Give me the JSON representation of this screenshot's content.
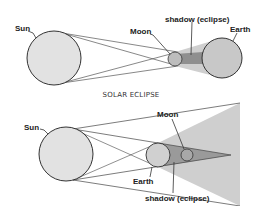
{
  "solar_diagram": {
    "labels": {
      "sun": "Sun",
      "moon": "Moon",
      "earth": "Earth",
      "shadow": "shadow (eclipse)"
    }
  },
  "caption": "SOLAR ECLIPSE",
  "lunar_diagram": {
    "labels": {
      "sun": "Sun",
      "moon": "Moon",
      "earth": "Earth",
      "shadow": "shadow (eclipse)"
    }
  },
  "colors": {
    "body_fill": "#d9d9d9",
    "penumbra": "#cfcfcf",
    "umbra": "#9a9a9a",
    "stroke": "#333333"
  }
}
